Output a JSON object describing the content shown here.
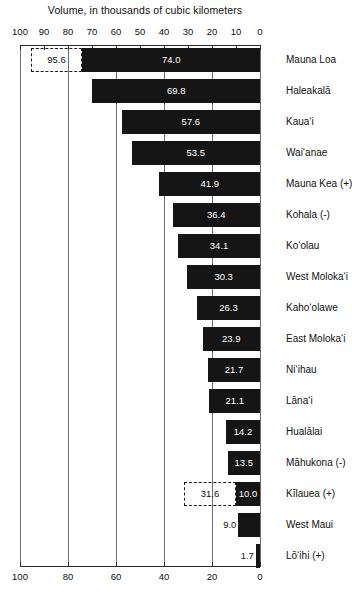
{
  "chart_data": {
    "type": "bar",
    "orientation": "horizontal-reversed",
    "title": "Volume, in thousands of cubic kilometers",
    "xlabel": "",
    "ylabel": "",
    "xlim": [
      100,
      0
    ],
    "axis_direction": "decreasing left-to-right",
    "grid": true,
    "legend": null,
    "tick_labels_top": [
      "100",
      "90",
      "80",
      "70",
      "60",
      "50",
      "40",
      "30",
      "20",
      "10",
      "0"
    ],
    "tick_values_top": [
      100,
      90,
      80,
      70,
      60,
      50,
      40,
      30,
      20,
      10,
      0
    ],
    "tick_labels_bottom": [
      "100",
      "80",
      "60",
      "40",
      "20",
      "0"
    ],
    "tick_values_bottom": [
      100,
      80,
      60,
      40,
      20,
      0
    ],
    "gridline_values": [
      100,
      80,
      60,
      40,
      20,
      0
    ],
    "categories": [
      "Mauna Loa",
      "Haleakalā",
      "Kaua‘i",
      "Wai‘anae",
      "Mauna Kea (+)",
      "Kohala (-)",
      "Ko‘olau",
      "West Moloka‘i",
      "Kaho‘olawe",
      "East Moloka‘i",
      "Ni‘ihau",
      "Lāna‘i",
      "Hualālai",
      "Māhukona (-)",
      "Kīlauea (+)",
      "West Maui",
      "Lō‘ihi (+)"
    ],
    "values": [
      74.0,
      69.8,
      57.6,
      53.5,
      41.9,
      36.4,
      34.1,
      30.3,
      26.3,
      23.9,
      21.7,
      21.1,
      14.2,
      13.5,
      10.0,
      9.0,
      1.7
    ],
    "value_labels": [
      "74.0",
      "69.8",
      "57.6",
      "53.5",
      "41.9",
      "36.4",
      "34.1",
      "30.3",
      "26.3",
      "23.9",
      "21.7",
      "21.1",
      "14.2",
      "13.5",
      "10.0",
      "9.0",
      "1.7"
    ],
    "extensions": [
      {
        "category": "Mauna Loa",
        "label": "95.6",
        "value": 95.6
      },
      {
        "category": "Kīlauea (+)",
        "label": "31.6",
        "value": 31.6
      }
    ],
    "colors": {
      "bar": "#151515",
      "bar_label": "#ffffff",
      "grid": "#6e6e6e",
      "axis": "#2a2a2a",
      "text": "#111111",
      "background": "#ffffff"
    }
  },
  "rows": [
    {
      "label": "Mauna Loa",
      "value": 74.0,
      "value_label": "74.0",
      "ext_label": "95.6",
      "ext_value": 95.6
    },
    {
      "label": "Haleakalā",
      "value": 69.8,
      "value_label": "69.8",
      "ext_label": null,
      "ext_value": null
    },
    {
      "label": "Kaua‘i",
      "value": 57.6,
      "value_label": "57.6",
      "ext_label": null,
      "ext_value": null
    },
    {
      "label": "Wai‘anae",
      "value": 53.5,
      "value_label": "53.5",
      "ext_label": null,
      "ext_value": null
    },
    {
      "label": "Mauna Kea (+)",
      "value": 41.9,
      "value_label": "41.9",
      "ext_label": null,
      "ext_value": null
    },
    {
      "label": "Kohala (-)",
      "value": 36.4,
      "value_label": "36.4",
      "ext_label": null,
      "ext_value": null
    },
    {
      "label": "Ko‘olau",
      "value": 34.1,
      "value_label": "34.1",
      "ext_label": null,
      "ext_value": null
    },
    {
      "label": "West Moloka‘i",
      "value": 30.3,
      "value_label": "30.3",
      "ext_label": null,
      "ext_value": null
    },
    {
      "label": "Kaho‘olawe",
      "value": 26.3,
      "value_label": "26.3",
      "ext_label": null,
      "ext_value": null
    },
    {
      "label": "East Moloka‘i",
      "value": 23.9,
      "value_label": "23.9",
      "ext_label": null,
      "ext_value": null
    },
    {
      "label": "Ni‘ihau",
      "value": 21.7,
      "value_label": "21.7",
      "ext_label": null,
      "ext_value": null
    },
    {
      "label": "Lāna‘i",
      "value": 21.1,
      "value_label": "21.1",
      "ext_label": null,
      "ext_value": null
    },
    {
      "label": "Hualālai",
      "value": 14.2,
      "value_label": "14.2",
      "ext_label": null,
      "ext_value": null
    },
    {
      "label": "Māhukona (-)",
      "value": 13.5,
      "value_label": "13.5",
      "ext_label": null,
      "ext_value": null
    },
    {
      "label": "Kīlauea (+)",
      "value": 10.0,
      "value_label": "10.0",
      "ext_label": "31.6",
      "ext_value": 31.6
    },
    {
      "label": "West Maui",
      "value": 9.0,
      "value_label": "9.0",
      "ext_label": null,
      "ext_value": null
    },
    {
      "label": "Lō‘ihi (+)",
      "value": 1.7,
      "value_label": "1.7",
      "ext_label": null,
      "ext_value": null
    }
  ]
}
